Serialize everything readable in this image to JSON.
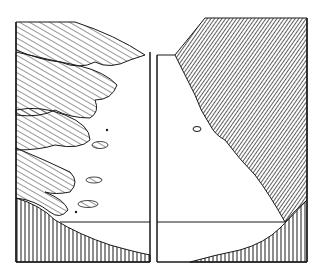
{
  "figure": {
    "colors": {
      "ink": "#1a1a1a",
      "paper": "#ffffff"
    },
    "panels": [
      {
        "name": "left-panel",
        "features": [
          "scalloped-hills",
          "small-boulders",
          "vertical-hatched-base"
        ]
      },
      {
        "name": "right-panel",
        "features": [
          "dense-hatched-cliff",
          "single-boulder",
          "vertical-hatched-base"
        ]
      }
    ]
  }
}
